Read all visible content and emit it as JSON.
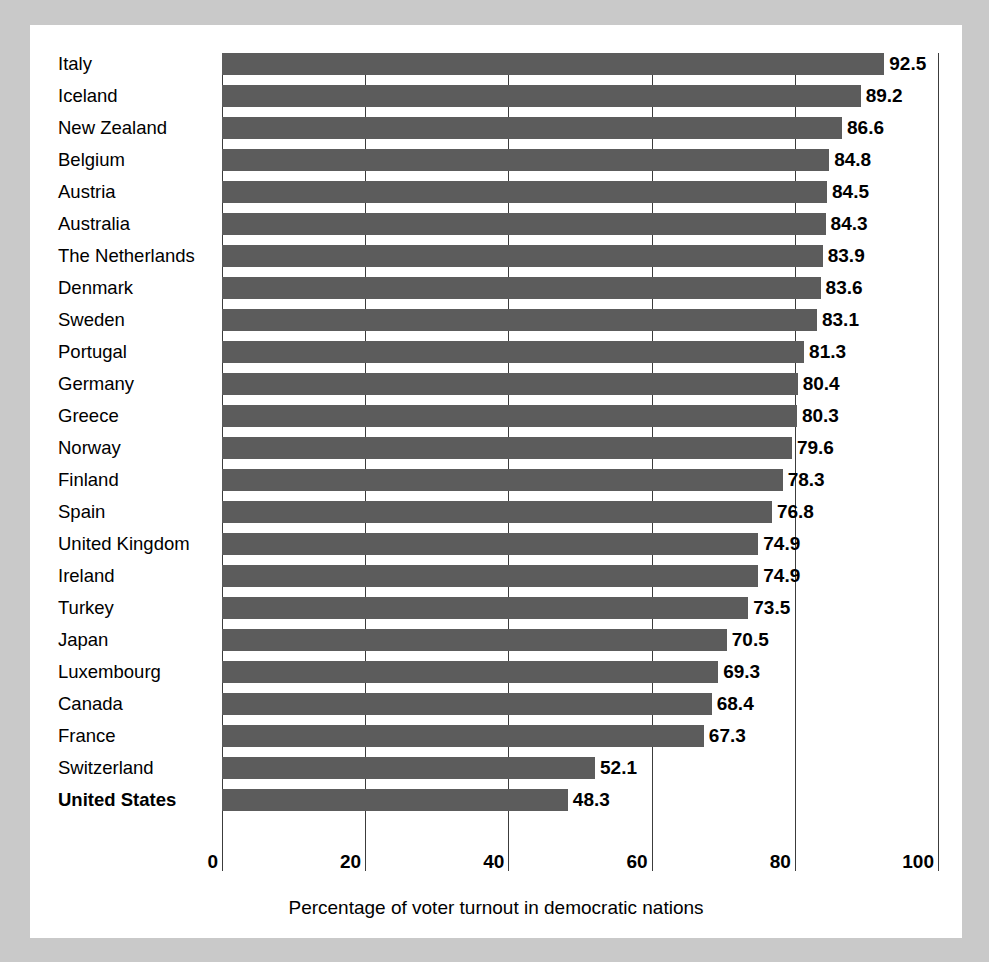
{
  "chart_data": {
    "type": "bar",
    "orientation": "horizontal",
    "title": "",
    "xlabel": "Percentage of voter turnout in democratic nations",
    "ylabel": "",
    "xlim": [
      0,
      100
    ],
    "xticks": [
      0,
      20,
      40,
      60,
      80,
      100
    ],
    "grid": true,
    "legend": "none",
    "bar_color": "#5c5c5c",
    "background_color": "#ffffff",
    "page_background_color": "#c9c9c9",
    "axis_color": "#3c3c3c",
    "highlighted_category": "United States",
    "categories": [
      "Italy",
      "Iceland",
      "New Zealand",
      "Belgium",
      "Austria",
      "Australia",
      "The Netherlands",
      "Denmark",
      "Sweden",
      "Portugal",
      "Germany",
      "Greece",
      "Norway",
      "Finland",
      "Spain",
      "United Kingdom",
      "Ireland",
      "Turkey",
      "Japan",
      "Luxembourg",
      "Canada",
      "France",
      "Switzerland",
      "United States"
    ],
    "values": [
      92.5,
      89.2,
      86.6,
      84.8,
      84.5,
      84.3,
      83.9,
      83.6,
      83.1,
      81.3,
      80.4,
      80.3,
      79.6,
      78.3,
      76.8,
      74.9,
      74.9,
      73.5,
      70.5,
      69.3,
      68.4,
      67.3,
      52.1,
      48.3
    ],
    "value_labels": [
      "92.5",
      "89.2",
      "86.6",
      "84.8",
      "84.5",
      "84.3",
      "83.9",
      "83.6",
      "83.1",
      "81.3",
      "80.4",
      "80.3",
      "79.6",
      "78.3",
      "76.8",
      "74.9",
      "74.9",
      "73.5",
      "70.5",
      "69.3",
      "68.4",
      "67.3",
      "52.1",
      "48.3"
    ],
    "xtick_labels": [
      "0",
      "20",
      "40",
      "60",
      "80",
      "100"
    ]
  }
}
